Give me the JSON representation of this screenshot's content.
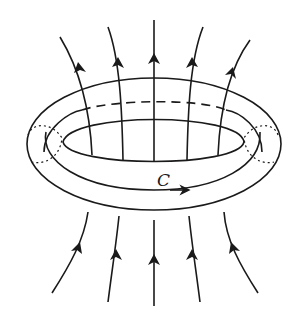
{
  "diagram": {
    "labels": {
      "loop": "C"
    },
    "colors": {
      "stroke": "#1a1a1a",
      "background": "#ffffff"
    },
    "field_lines": {
      "count_above": 5,
      "count_below": 5,
      "direction": "upward"
    }
  }
}
